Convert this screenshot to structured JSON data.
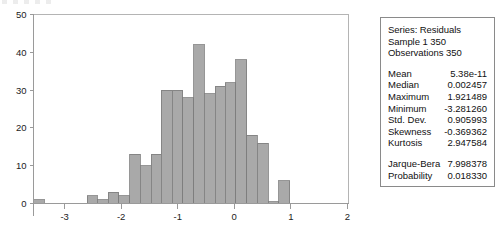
{
  "chart_data": {
    "type": "bar",
    "subtype": "histogram",
    "title": "",
    "xlabel": "",
    "ylabel": "",
    "xlim": [
      -3.55,
      2.02
    ],
    "ylim": [
      0,
      50
    ],
    "grid": false,
    "legend": null,
    "bin_width": 0.1886,
    "x_ticks": [
      -3,
      -2,
      -1,
      0,
      1,
      2
    ],
    "x_tick_labels": [
      "-3",
      "-2",
      "-1",
      "0",
      "1",
      "2"
    ],
    "y_ticks": [
      0,
      10,
      20,
      30,
      40,
      50
    ],
    "y_tick_labels": [
      "0",
      "10",
      "20",
      "30",
      "40",
      "50"
    ],
    "bins": [
      {
        "x0": -3.55,
        "x1": -3.36,
        "value": 1
      },
      {
        "x0": -3.36,
        "x1": -3.17,
        "value": 0
      },
      {
        "x0": -3.17,
        "x1": -2.98,
        "value": 0
      },
      {
        "x0": -2.98,
        "x1": -2.79,
        "value": 0
      },
      {
        "x0": -2.79,
        "x1": -2.6,
        "value": 0
      },
      {
        "x0": -2.6,
        "x1": -2.42,
        "value": 2
      },
      {
        "x0": -2.42,
        "x1": -2.23,
        "value": 1
      },
      {
        "x0": -2.23,
        "x1": -2.04,
        "value": 3
      },
      {
        "x0": -2.04,
        "x1": -1.85,
        "value": 2
      },
      {
        "x0": -1.85,
        "x1": -1.66,
        "value": 13
      },
      {
        "x0": -1.66,
        "x1": -1.47,
        "value": 10
      },
      {
        "x0": -1.47,
        "x1": -1.29,
        "value": 13
      },
      {
        "x0": -1.29,
        "x1": -1.1,
        "value": 30
      },
      {
        "x0": -1.1,
        "x1": -0.91,
        "value": 30
      },
      {
        "x0": -0.91,
        "x1": -0.72,
        "value": 28
      },
      {
        "x0": -0.72,
        "x1": -0.53,
        "value": 42
      },
      {
        "x0": -0.53,
        "x1": -0.34,
        "value": 29
      },
      {
        "x0": -0.34,
        "x1": -0.16,
        "value": 31
      },
      {
        "x0": -0.16,
        "x1": 0.03,
        "value": 32
      },
      {
        "x0": 0.03,
        "x1": 0.22,
        "value": 38
      },
      {
        "x0": 0.22,
        "x1": 0.41,
        "value": 18
      },
      {
        "x0": 0.41,
        "x1": 0.6,
        "value": 16
      },
      {
        "x0": 0.6,
        "x1": 0.79,
        "value": 0.4
      },
      {
        "x0": 0.79,
        "x1": 0.98,
        "value": 6
      }
    ],
    "bar_color": "#a9a9a9",
    "bar_edge_color": "#7c7c7c"
  },
  "stats_panel": {
    "header": [
      "Series: Residuals",
      "Sample 1 350",
      "Observations 350"
    ],
    "rows": [
      {
        "name": "Mean",
        "value": "5.38e-11"
      },
      {
        "name": "Median",
        "value": "0.002457"
      },
      {
        "name": "Maximum",
        "value": "1.921489"
      },
      {
        "name": "Minimum",
        "value": "-3.281260"
      },
      {
        "name": "Std. Dev.",
        "value": "0.905993"
      },
      {
        "name": "Skewness",
        "value": "-0.369362"
      },
      {
        "name": "Kurtosis",
        "value": "2.947584"
      }
    ],
    "test_rows": [
      {
        "name": "Jarque-Bera",
        "value": "7.998378"
      },
      {
        "name": "Probability",
        "value": "0.018330"
      }
    ]
  }
}
